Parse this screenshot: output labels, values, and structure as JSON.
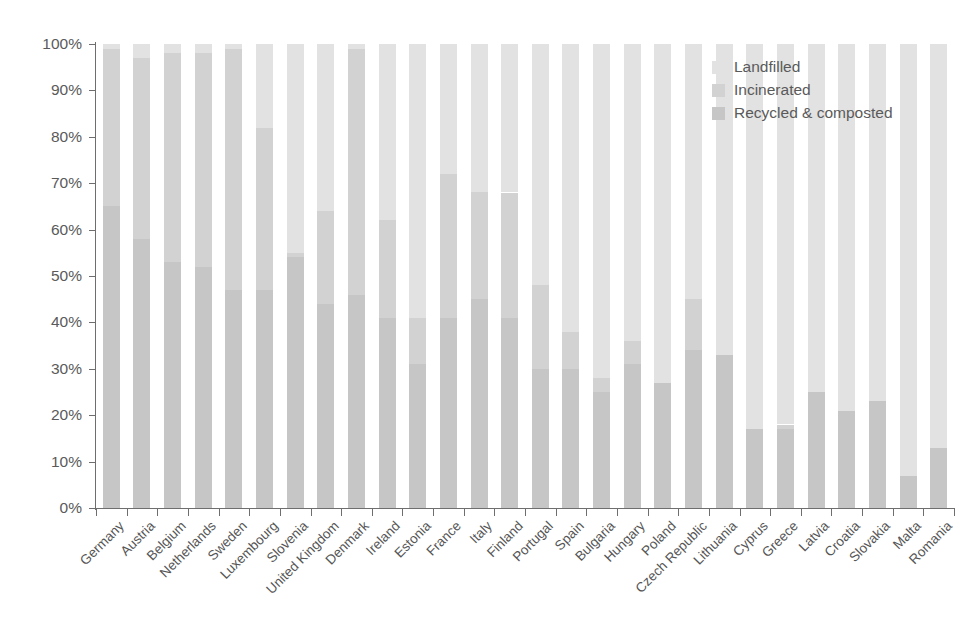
{
  "chart_data": {
    "type": "bar",
    "subtype": "stacked-bar-100-percent",
    "title": "",
    "subtitle": "",
    "xlabel": "",
    "ylabel": "",
    "ylim": [
      0,
      100
    ],
    "grid": false,
    "legend_position": "top-right",
    "y_tick_labels": [
      "0%",
      "10%",
      "20%",
      "30%",
      "40%",
      "50%",
      "60%",
      "70%",
      "80%",
      "90%",
      "100%"
    ],
    "y_tick_values": [
      0,
      10,
      20,
      30,
      40,
      50,
      60,
      70,
      80,
      90,
      100
    ],
    "categories": [
      "Germany",
      "Austria",
      "Belgium",
      "Netherlands",
      "Sweden",
      "Luxembourg",
      "Slovenia",
      "United Kingdom",
      "Denmark",
      "Ireland",
      "Estonia",
      "France",
      "Italy",
      "Finland",
      "Portugal",
      "Spain",
      "Bulgaria",
      "Hungary",
      "Poland",
      "Czech Republic",
      "Lithuania",
      "Cyprus",
      "Greece",
      "Latvia",
      "Croatia",
      "Slovakia",
      "Malta",
      "Romania"
    ],
    "series": [
      {
        "name": "Recycled & composted",
        "color": "#c6c6c6",
        "values": [
          65,
          58,
          53,
          52,
          47,
          47,
          54,
          44,
          46,
          41,
          31,
          41,
          45,
          41,
          30,
          30,
          25,
          31,
          27,
          34,
          33,
          17,
          17,
          25,
          21,
          23,
          7,
          13
        ]
      },
      {
        "name": "Incinerated",
        "color": "#d2d2d2",
        "values": [
          34,
          39,
          45,
          46,
          52,
          35,
          1,
          20,
          53,
          21,
          10,
          31,
          23,
          27,
          18,
          8,
          3,
          5,
          0,
          11,
          0,
          0,
          1,
          0,
          0,
          0,
          0,
          0
        ]
      },
      {
        "name": "Landfilled",
        "color": "#e2e2e2",
        "values": [
          1,
          3,
          2,
          2,
          1,
          18,
          45,
          36,
          1,
          38,
          59,
          28,
          32,
          32,
          52,
          62,
          72,
          64,
          73,
          55,
          67,
          83,
          82,
          75,
          79,
          77,
          93,
          87
        ]
      }
    ],
    "stack_order_bottom_to_top": [
      "Recycled & composted",
      "Incinerated",
      "Landfilled"
    ],
    "bar_totals_percent": [
      100,
      100,
      100,
      100,
      100,
      100,
      100,
      100,
      100,
      100,
      100,
      100,
      100,
      100,
      100,
      100,
      100,
      100,
      100,
      100,
      100,
      100,
      100,
      100,
      100,
      100,
      100,
      100
    ]
  },
  "legend": {
    "items": [
      {
        "label": "Landfilled",
        "color": "#e2e2e2"
      },
      {
        "label": "Incinerated",
        "color": "#d2d2d2"
      },
      {
        "label": "Recycled & composted",
        "color": "#c6c6c6"
      }
    ]
  }
}
